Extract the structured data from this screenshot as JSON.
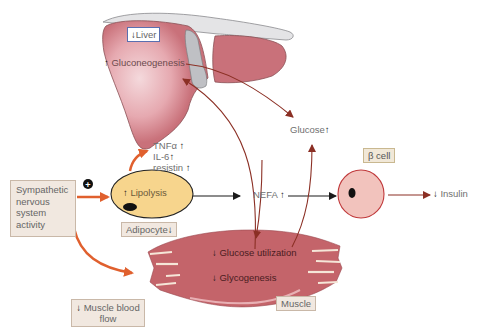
{
  "diagram": {
    "nodes": {
      "liver": {
        "label": "Liver",
        "arrow": "↓"
      },
      "gluconeogenesis": {
        "label": "Gluconeogenesis",
        "arrow": "↑"
      },
      "glucose": {
        "label": "Glucose",
        "arrow": "↑"
      },
      "cytokines": [
        {
          "label": "TNFα",
          "arrow": "↑"
        },
        {
          "label": "IL-6",
          "arrow": "↑"
        },
        {
          "label": "resistin",
          "arrow": "↑"
        }
      ],
      "sympathetic": {
        "label": "Sympathetic nervous system activity",
        "lines": [
          "Sympathetic",
          "nervous",
          "system",
          "activity"
        ]
      },
      "plus_sign": "+",
      "lipolysis": {
        "label": "Lipolysis",
        "arrow": "↑"
      },
      "adipocyte": {
        "label": "Adipocyte",
        "arrow": "↓"
      },
      "nefa": {
        "label": "NEFA",
        "arrow": "↑"
      },
      "beta_cell": {
        "label": "β cell"
      },
      "insulin": {
        "label": "Insulin",
        "arrow": "↓"
      },
      "glucose_utilization": {
        "label": "Glucose utilization",
        "arrow": "↓"
      },
      "glycogenesis": {
        "label": "Glycogenesis",
        "arrow": "↓"
      },
      "muscle": {
        "label": "Muscle"
      },
      "muscle_blood_flow": {
        "label": "Muscle blood flow",
        "arrow": "↓",
        "lines": [
          "Muscle blood",
          "flow"
        ]
      }
    },
    "colors": {
      "liver_fill": "#c9717a",
      "liver_highlight": "#f2d3d6",
      "muscle_fill": "#c4646a",
      "adipocyte_fill": "#f7d58d",
      "beta_cell_fill": "#f2c3bd",
      "orange_arrow": "#e0602e",
      "dark_red_arrow": "#8b2f24",
      "black_arrow": "#1a1a1a",
      "box_fill": "#f1e8e0"
    }
  }
}
